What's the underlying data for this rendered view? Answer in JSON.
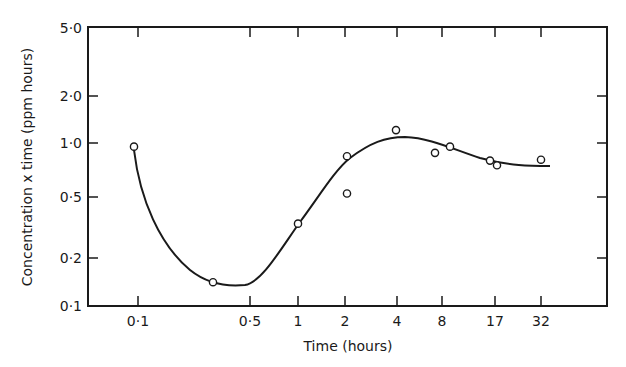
{
  "chart_data": {
    "type": "scatter",
    "title": "",
    "xlabel": "Time (hours)",
    "ylabel": "Concentration x time (ppm hours)",
    "xscale": "log-like (nonuniform)",
    "yscale": "log",
    "ylim": [
      0.1,
      5.0
    ],
    "x_ticks": [
      "0·1",
      "0·5",
      "1",
      "2",
      "4",
      "8",
      "17",
      "32"
    ],
    "y_ticks": [
      "0·1",
      "0·2",
      "0·5",
      "1·0",
      "2·0",
      "5·0"
    ],
    "grid": false,
    "legend": null,
    "series": [
      {
        "name": "observations",
        "marker": "open-circle",
        "points": [
          {
            "x": 0.1,
            "y": 0.95
          },
          {
            "x": 0.3,
            "y": 0.14
          },
          {
            "x": 1,
            "y": 0.32
          },
          {
            "x": 2,
            "y": 0.83
          },
          {
            "x": 2,
            "y": 0.49
          },
          {
            "x": 4,
            "y": 1.2
          },
          {
            "x": 7,
            "y": 0.87
          },
          {
            "x": 9,
            "y": 0.95
          },
          {
            "x": 16,
            "y": 0.78
          },
          {
            "x": 18,
            "y": 0.73
          },
          {
            "x": 32,
            "y": 0.79
          }
        ]
      },
      {
        "name": "fitted curve",
        "type": "line",
        "points": [
          {
            "x": 0.1,
            "y": 0.95
          },
          {
            "x": 0.3,
            "y": 0.14
          },
          {
            "x": 0.5,
            "y": 0.16
          },
          {
            "x": 1,
            "y": 0.35
          },
          {
            "x": 2,
            "y": 0.78
          },
          {
            "x": 4,
            "y": 1.0
          },
          {
            "x": 8,
            "y": 0.92
          },
          {
            "x": 17,
            "y": 0.77
          },
          {
            "x": 40,
            "y": 0.73
          }
        ]
      }
    ]
  },
  "axes": {
    "x_title": "Time (hours)",
    "y_title": "Concentration x time (ppm hours)",
    "x_ticks": [
      {
        "label": "0·1",
        "px": 138
      },
      {
        "label": "0·5",
        "px": 250
      },
      {
        "label": "1",
        "px": 298
      },
      {
        "label": "2",
        "px": 345
      },
      {
        "label": "4",
        "px": 397
      },
      {
        "label": "8",
        "px": 442
      },
      {
        "label": "17",
        "px": 495
      },
      {
        "label": "32",
        "px": 541
      }
    ],
    "y_ticks": [
      {
        "label": "5·0",
        "py": 28
      },
      {
        "label": "2·0",
        "py": 96
      },
      {
        "label": "1·0",
        "py": 143
      },
      {
        "label": "0·5",
        "py": 197
      },
      {
        "label": "0·2",
        "py": 258
      },
      {
        "label": "0·1",
        "py": 306
      }
    ]
  },
  "colors": {
    "ink": "#1a1a1a",
    "background": "#ffffff"
  }
}
